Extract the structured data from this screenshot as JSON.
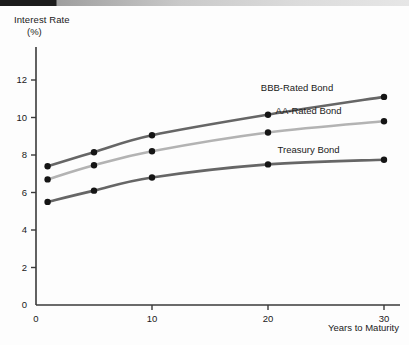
{
  "figure": {
    "top_bar_dark_color": "#1c1c1c",
    "top_bar_light_color": "#c9c9c9",
    "background_color": "#fdfdfd"
  },
  "axes": {
    "y_title": "Interest Rate",
    "y_unit": "(%)",
    "x_title": "Years to Maturity",
    "y_ticks": [
      "12",
      "10",
      "8",
      "6",
      "4",
      "2",
      "0"
    ],
    "x_ticks": [
      "0",
      "10",
      "20",
      "30"
    ]
  },
  "chart_data": {
    "type": "line",
    "title": "",
    "subtitle": "",
    "xlabel": "Years to Maturity",
    "ylabel": "Interest Rate (%)",
    "xlim": [
      0,
      30
    ],
    "ylim": [
      0,
      13
    ],
    "grid": false,
    "legend_position": "inline-right",
    "x": [
      1,
      5,
      10,
      20,
      30
    ],
    "x_tick_values": [
      0,
      10,
      20,
      30
    ],
    "y_tick_values": [
      0,
      2,
      4,
      6,
      8,
      10,
      12
    ],
    "series": [
      {
        "name": "BBB-Rated Bond",
        "color": "#666666",
        "marker_color": "#151515",
        "values": [
          7.4,
          8.15,
          9.05,
          10.15,
          11.1
        ]
      },
      {
        "name": "AA-Rated Bond",
        "color": "#b3b3b3",
        "marker_color": "#151515",
        "values": [
          6.7,
          7.45,
          8.2,
          9.2,
          9.8
        ]
      },
      {
        "name": "Treasury Bond",
        "color": "#666666",
        "marker_color": "#151515",
        "values": [
          5.5,
          6.1,
          6.8,
          7.5,
          7.75
        ]
      }
    ],
    "annotations": [
      {
        "text": "BBB-Rated Bond",
        "x": 22.5,
        "y": 11.6
      },
      {
        "text": "AA-Rated Bond",
        "x": 23.5,
        "y": 10.35
      },
      {
        "text": "Treasury Bond",
        "x": 23.5,
        "y": 8.3
      }
    ]
  }
}
